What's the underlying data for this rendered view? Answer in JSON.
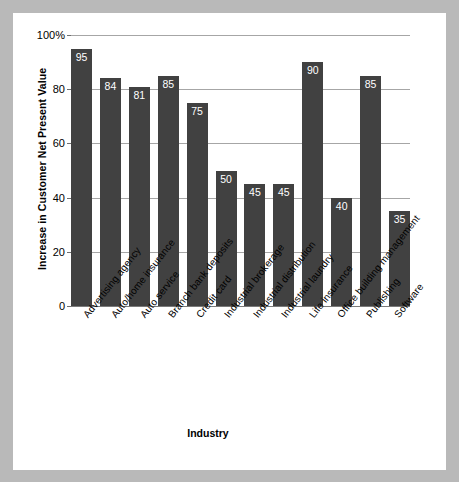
{
  "chart_data": {
    "type": "bar",
    "title": "",
    "xlabel": "Industry",
    "ylabel": "Increase in Customer Net Present Value",
    "ylim": [
      0,
      100
    ],
    "grid": true,
    "legend": false,
    "orientation": "vertical",
    "bar_color": "#414141",
    "value_label_color": "#ffffff",
    "gridline_color": "#a6a6a6",
    "background": "#ffffff",
    "mat_color": "#b9b9b9",
    "yticks": [
      {
        "value": 0,
        "label": "0"
      },
      {
        "value": 20,
        "label": "20"
      },
      {
        "value": 40,
        "label": "40"
      },
      {
        "value": 60,
        "label": "60"
      },
      {
        "value": 80,
        "label": "80"
      },
      {
        "value": 100,
        "label": "100%"
      }
    ],
    "categories": [
      "Advertising agency",
      "Auto/home insurance",
      "Auto service",
      "Branch bank deposits",
      "Credit card",
      "Industrial brokerage",
      "Industrial distribution",
      "Industrial laundry",
      "Life insurance",
      "Office building management",
      "Publishing",
      "Software"
    ],
    "values": [
      95,
      84,
      81,
      85,
      75,
      50,
      45,
      45,
      90,
      40,
      85,
      35
    ],
    "value_labels": [
      "95",
      "84",
      "81",
      "85",
      "75",
      "50",
      "45",
      "45",
      "90",
      "40",
      "85",
      "35"
    ]
  },
  "caption": {
    "sliver_text": ""
  }
}
